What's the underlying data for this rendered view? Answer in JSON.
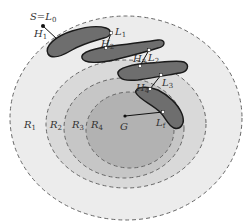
{
  "diagram": {
    "colors": {
      "background": "#ffffff",
      "ring_r1": "#ececec",
      "ring_r2": "#d9d9d9",
      "ring_r3": "#c6c6c6",
      "ring_r4": "#b2b2b2",
      "dash_stroke": "#666666",
      "blob_fill": "#6e6e6e",
      "blob_outline": "#1a1a1a",
      "line": "#111111",
      "point_fill": "#ffffff"
    },
    "regions": [
      {
        "id": "R1",
        "main": "R",
        "sub": "1"
      },
      {
        "id": "R2",
        "main": "R",
        "sub": "2"
      },
      {
        "id": "R3",
        "main": "R",
        "sub": "3"
      },
      {
        "id": "R4",
        "main": "R",
        "sub": "4"
      }
    ],
    "labels": {
      "start": {
        "text": "S=L",
        "sub": "0"
      },
      "H1": {
        "main": "H",
        "sub": "1"
      },
      "H2": {
        "main": "H",
        "sub": "2"
      },
      "H3": {
        "main": "H",
        "sub": "3"
      },
      "H4": {
        "main": "H",
        "sub": "4"
      },
      "L1": {
        "main": "L",
        "sub": "1"
      },
      "L2": {
        "main": "L",
        "sub": "2"
      },
      "L3": {
        "main": "L",
        "sub": "3"
      },
      "Lf": {
        "main": "L",
        "sub": "f"
      },
      "goal": {
        "main": "G"
      }
    }
  }
}
